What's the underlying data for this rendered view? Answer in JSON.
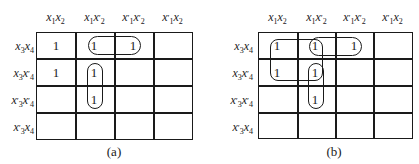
{
  "figure": {
    "column_headers": [
      "x1x2",
      "x1x2'",
      "x1'x2'",
      "x1'x2"
    ],
    "row_headers": [
      "x3x4",
      "x3x4'",
      "x3'x4'",
      "x3'x4"
    ],
    "one_symbol": "1",
    "maps": [
      {
        "caption": "(a)",
        "cells": [
          [
            "1",
            "1",
            "1",
            ""
          ],
          [
            "1",
            "1",
            "",
            ""
          ],
          [
            "",
            "1",
            "",
            ""
          ],
          [
            "",
            "",
            "",
            ""
          ]
        ],
        "groupings": [
          {
            "cells": [
              [
                0,
                1
              ],
              [
                0,
                2
              ]
            ],
            "label": "x1' x2' x3 x4 ... horizontal pair"
          },
          {
            "cells": [
              [
                1,
                1
              ],
              [
                2,
                1
              ]
            ],
            "label": "vertical pair"
          }
        ]
      },
      {
        "caption": "(b)",
        "cells": [
          [
            "1",
            "1",
            "1",
            ""
          ],
          [
            "1",
            "1",
            "",
            ""
          ],
          [
            "",
            "1",
            "",
            ""
          ],
          [
            "",
            "",
            "",
            ""
          ]
        ],
        "groupings": [
          {
            "cells": [
              [
                0,
                0
              ],
              [
                0,
                1
              ],
              [
                1,
                0
              ],
              [
                1,
                1
              ]
            ],
            "label": "quad"
          },
          {
            "cells": [
              [
                0,
                1
              ],
              [
                0,
                2
              ]
            ],
            "label": "horizontal pair"
          },
          {
            "cells": [
              [
                1,
                1
              ],
              [
                2,
                1
              ]
            ],
            "label": "vertical pair"
          }
        ]
      }
    ]
  }
}
